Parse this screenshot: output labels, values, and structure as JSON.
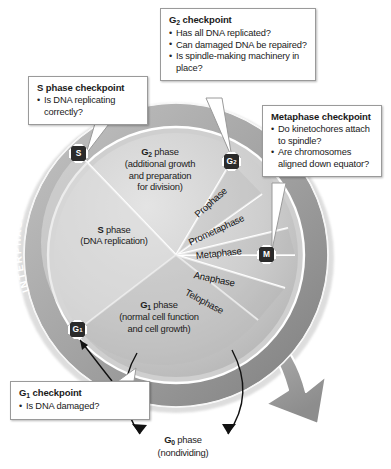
{
  "figure": {
    "kind": "cell-cycle-diagram",
    "outer_ring": {
      "interphase_label": "INTERPHASE",
      "cell_division_label": "CELL DIVISION"
    }
  },
  "callouts": [
    {
      "id": "g2",
      "title": "G2 checkpoint",
      "title_base": "G",
      "title_sub": "2",
      "title_rest": " checkpoint",
      "items": [
        "Has all DNA replicated?",
        "Can damaged DNA be repaired?",
        "Is spindle-making machinery in place?"
      ]
    },
    {
      "id": "s",
      "title": "S phase checkpoint",
      "items": [
        "Is DNA replicating correctly?"
      ]
    },
    {
      "id": "metaphase",
      "title": "Metaphase checkpoint",
      "items": [
        "Do kinetochores attach to spindle?",
        "Are chromosomes aligned down equator?"
      ]
    },
    {
      "id": "g1",
      "title": "G1 checkpoint",
      "title_base": "G",
      "title_sub": "1",
      "title_rest": " checkpoint",
      "items": [
        "Is DNA damaged?"
      ]
    }
  ],
  "phases": {
    "g2": {
      "name_base": "G",
      "name_sub": "2",
      "name_rest": " phase",
      "description_line1": "(additional growth",
      "description_line2": "and preparation",
      "description_line3": "for division)"
    },
    "s": {
      "name_base": "S",
      "name_rest": " phase",
      "description_line1": "(DNA replication)"
    },
    "g1": {
      "name_base": "G",
      "name_sub": "1",
      "name_rest": " phase",
      "description_line1": "(normal cell function",
      "description_line2": "and cell growth)"
    },
    "g0": {
      "name_base": "G",
      "name_sub": "0",
      "name_rest": " phase",
      "description_line1": "(nondividing)"
    }
  },
  "mitosis_stages": [
    "Prophase",
    "Prometaphase",
    "Metaphase",
    "Anaphase",
    "Telophase"
  ],
  "checkpoint_badges": [
    {
      "id": "s",
      "label_base": "S",
      "label_sub": ""
    },
    {
      "id": "g2",
      "label_base": "G",
      "label_sub": "2"
    },
    {
      "id": "m",
      "label_base": "M",
      "label_sub": ""
    },
    {
      "id": "g1",
      "label_base": "G",
      "label_sub": "1"
    }
  ],
  "colors": {
    "ring_dark": "#8c8c8c",
    "ring_light": "#c9c9c9",
    "disc_light": "#d5d5d5",
    "disc_mid": "#bdbdbd",
    "badge": "#2b2b2b",
    "callout_border": "#9a9a9a",
    "text": "#1a1a1a"
  }
}
